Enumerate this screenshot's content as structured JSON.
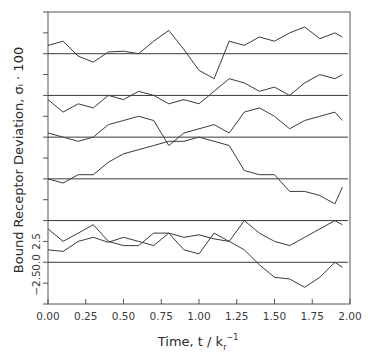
{
  "chart_data": {
    "type": "line",
    "title": "",
    "xlabel": "Time, t / k_r^-1",
    "ylabel": "Bound Receptor Deviation, σ_i · 100",
    "xlim": [
      0.0,
      2.0
    ],
    "ylim": [
      -5.0,
      30.0
    ],
    "grid": false,
    "legend": "none",
    "x_ticks": [
      "0.00",
      "0.25",
      "0.50",
      "0.75",
      "1.00",
      "1.25",
      "1.50",
      "1.75",
      "2.00"
    ],
    "y_tick_labels": [
      "-2.5",
      "0.0",
      "2.5"
    ],
    "y_tick_step": 2.5,
    "trace_offset_step": 5.0,
    "x": [
      0.0,
      0.1,
      0.2,
      0.3,
      0.4,
      0.5,
      0.6,
      0.7,
      0.8,
      0.9,
      1.0,
      1.1,
      1.2,
      1.3,
      1.4,
      1.5,
      1.6,
      1.7,
      1.8,
      1.9,
      1.95
    ],
    "series": [
      {
        "name": "trace-1",
        "baseline": 0.0,
        "values": [
          1.5,
          1.3,
          2.5,
          3.0,
          2.4,
          3.0,
          2.5,
          2.0,
          3.5,
          3.0,
          3.3,
          2.8,
          2.5,
          1.5,
          -0.3,
          -1.8,
          -2.0,
          -3.0,
          -1.8,
          0.0,
          -0.6
        ]
      },
      {
        "name": "trace-2",
        "baseline": 5.0,
        "values": [
          -1.0,
          -2.5,
          -1.5,
          -0.5,
          -2.5,
          -3.0,
          -3.0,
          -1.5,
          -1.5,
          -3.5,
          -4.0,
          -1.5,
          -2.5,
          0.0,
          -1.5,
          -2.5,
          -3.0,
          -2.0,
          -1.0,
          0.0,
          -0.5
        ]
      },
      {
        "name": "trace-3",
        "baseline": 10.0,
        "values": [
          0.0,
          -0.5,
          0.5,
          0.5,
          2.0,
          3.0,
          3.5,
          4.0,
          4.5,
          4.5,
          5.0,
          4.5,
          4.0,
          1.0,
          0.5,
          0.5,
          -1.5,
          -1.5,
          -2.0,
          -3.0,
          -1.0
        ]
      },
      {
        "name": "trace-4",
        "baseline": 15.0,
        "values": [
          0.5,
          0.0,
          -0.5,
          0.0,
          1.5,
          2.0,
          2.5,
          2.0,
          -1.0,
          0.5,
          1.0,
          1.5,
          0.5,
          3.0,
          3.5,
          2.5,
          1.0,
          2.0,
          2.5,
          3.0,
          2.0
        ]
      },
      {
        "name": "trace-5",
        "baseline": 20.0,
        "values": [
          -0.5,
          -2.0,
          -1.0,
          -1.5,
          0.0,
          -0.5,
          0.5,
          0.0,
          -1.0,
          -0.5,
          -1.0,
          0.5,
          2.0,
          1.5,
          0.5,
          1.0,
          0.0,
          1.5,
          2.5,
          2.0,
          2.5
        ]
      },
      {
        "name": "trace-6",
        "baseline": 25.0,
        "values": [
          1.0,
          1.5,
          -0.3,
          -1.0,
          0.2,
          0.3,
          0.0,
          1.5,
          2.8,
          0.5,
          -2.0,
          -3.0,
          1.5,
          1.0,
          2.0,
          1.5,
          2.5,
          3.2,
          1.8,
          2.5,
          2.0
        ]
      }
    ]
  },
  "labels": {
    "y_axis_title": "Bound Receptor Deviation, σᵢ · 100",
    "x_axis_title_main": "Time, t / k",
    "x_axis_title_sub": "r",
    "x_axis_title_sup": "−1"
  },
  "style": {
    "line_color": "#3a3a3a",
    "axis_color": "#555555",
    "background": "#ffffff"
  }
}
